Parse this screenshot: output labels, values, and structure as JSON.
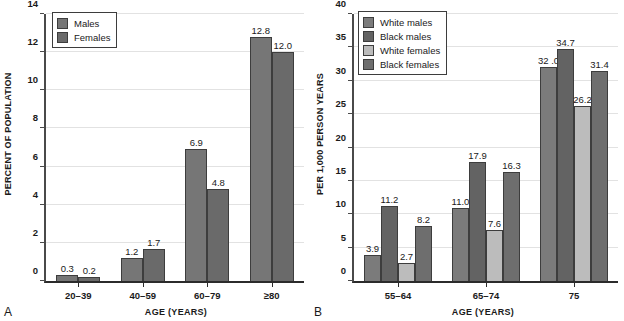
{
  "figure": {
    "panel_a_letter": "A",
    "panel_b_letter": "B"
  },
  "chart_data": [
    {
      "panel": "A",
      "type": "bar",
      "title": "",
      "xlabel": "AGE (YEARS)",
      "ylabel": "PERCENT OF POPULATION",
      "categories": [
        "20–39",
        "40–59",
        "60–79",
        "≥80"
      ],
      "ylim": [
        0,
        14
      ],
      "yticks": [
        0,
        2,
        4,
        6,
        8,
        10,
        12,
        14
      ],
      "ytick_labels": [
        "0",
        "2",
        "4",
        "6",
        "8",
        "10",
        "12",
        "14"
      ],
      "grid": true,
      "legend_position": "top-left",
      "series": [
        {
          "name": "Males",
          "color": "#767676",
          "values": [
            0.3,
            1.2,
            6.9,
            12.8
          ],
          "labels": [
            "0.3",
            "1.2",
            "6.9",
            "12.8"
          ]
        },
        {
          "name": "Females",
          "color": "#6a6a6a",
          "values": [
            0.2,
            1.7,
            4.8,
            12.0
          ],
          "labels": [
            "0.2",
            "1.7",
            "4.8",
            "12.0"
          ]
        }
      ]
    },
    {
      "panel": "B",
      "type": "bar",
      "title": "",
      "xlabel": "AGE (YEARS)",
      "ylabel": "PER 1,000 PERSON YEARS",
      "categories": [
        "55–64",
        "65–74",
        "75"
      ],
      "ylim": [
        0,
        40
      ],
      "yticks": [
        0,
        5,
        10,
        15,
        20,
        25,
        30,
        35,
        40
      ],
      "ytick_labels": [
        "0",
        "5",
        "10",
        "15",
        "20",
        "25",
        "30",
        "35",
        "40"
      ],
      "grid": true,
      "legend_position": "top-left",
      "series": [
        {
          "name": "White males",
          "color": "#7b7b7b",
          "values": [
            3.9,
            11.0,
            32.0
          ],
          "labels": [
            "3.9",
            "11.0",
            "32 .0"
          ]
        },
        {
          "name": "Black males",
          "color": "#636363",
          "values": [
            11.2,
            17.9,
            34.7
          ],
          "labels": [
            "11.2",
            "17.9",
            "34.7"
          ]
        },
        {
          "name": "White females",
          "color": "#bcbcbc",
          "values": [
            2.7,
            7.6,
            26.2
          ],
          "labels": [
            "2.7",
            "7.6",
            "26.2"
          ]
        },
        {
          "name": "Black females",
          "color": "#6e6e6e",
          "values": [
            8.2,
            16.3,
            31.4
          ],
          "labels": [
            "8.2",
            "16.3",
            "31.4"
          ]
        }
      ]
    }
  ]
}
